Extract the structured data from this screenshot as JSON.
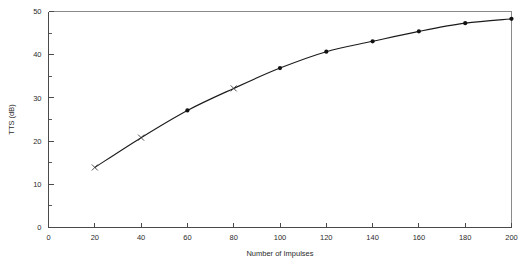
{
  "chart_data": {
    "type": "line",
    "title": "",
    "subtitle": "",
    "xlabel": "Number of Impulses",
    "ylabel": "TTS (dB)",
    "xlim": [
      0,
      200
    ],
    "ylim": [
      0,
      50
    ],
    "xticks": [
      0,
      20,
      40,
      60,
      80,
      100,
      120,
      140,
      160,
      180,
      200
    ],
    "xtick_labels": [
      "0",
      "20",
      "40",
      "60",
      "80",
      "100",
      "120",
      "140",
      "160",
      "180",
      "200"
    ],
    "yticks": [
      0,
      10,
      20,
      30,
      40,
      50
    ],
    "ytick_labels": [
      "0",
      "10",
      "20",
      "30",
      "40",
      "50"
    ],
    "grid": false,
    "legend": null,
    "legend_position": "none",
    "x": [
      20,
      40,
      60,
      80,
      100,
      120,
      140,
      160,
      180,
      200
    ],
    "values": [
      13.9,
      20.8,
      27.1,
      32.2,
      36.9,
      40.7,
      43.1,
      45.4,
      47.3,
      48.3
    ],
    "markers": [
      "cross",
      "cross",
      "dot",
      "cross",
      "dot",
      "dot",
      "dot",
      "dot",
      "dot",
      "dot"
    ],
    "series": [
      {
        "name": "TTS growth",
        "x": [
          20,
          40,
          60,
          80,
          100,
          120,
          140,
          160,
          180,
          200
        ],
        "values": [
          13.9,
          20.8,
          27.1,
          32.2,
          36.9,
          40.7,
          43.1,
          45.4,
          47.3,
          48.3
        ]
      }
    ],
    "line_color": "#1b1b1b",
    "marker_color": "#121212",
    "axis_color": "#4a4a4a",
    "background_color": "#ffffff"
  }
}
